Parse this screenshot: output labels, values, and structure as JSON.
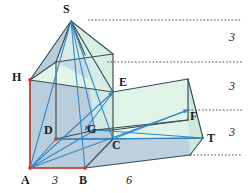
{
  "figure": {
    "colors": {
      "face_front_blue": "#b9cedc",
      "face_top_green": "#dff4e6",
      "face_side_green": "#cfeadd",
      "edge_dark": "#3a4a55",
      "construction_blue": "#2f86c8",
      "marker_red": "#e2382c",
      "dotted_gray": "#4a4a4a",
      "text": "#1b1b22"
    },
    "vertices": [
      {
        "name": "S",
        "label": "S",
        "x": 71,
        "y": 21,
        "lx": 63,
        "ly": 3
      },
      {
        "name": "H",
        "label": "H",
        "x": 30,
        "y": 80,
        "lx": 13,
        "ly": 71
      },
      {
        "name": "E",
        "label": "E",
        "x": 113,
        "y": 92,
        "lx": 119,
        "ly": 76
      },
      {
        "name": "F",
        "label": "F",
        "x": 188,
        "y": 110,
        "lx": 189,
        "ly": 108
      },
      {
        "name": "D",
        "label": "D",
        "x": 56,
        "y": 139,
        "lx": 44,
        "ly": 124
      },
      {
        "name": "G",
        "label": "G",
        "x": 95,
        "y": 130,
        "lx": 88,
        "ly": 124
      },
      {
        "name": "C",
        "label": "C",
        "x": 113,
        "y": 139,
        "lx": 112,
        "ly": 138
      },
      {
        "name": "T",
        "label": "T",
        "x": 203,
        "y": 138,
        "lx": 206,
        "ly": 132
      },
      {
        "name": "A",
        "label": "A",
        "x": 30,
        "y": 168,
        "lx": 22,
        "ly": 174
      },
      {
        "name": "B",
        "label": "B",
        "x": 85,
        "y": 168,
        "lx": 80,
        "ly": 174
      }
    ],
    "dimensions": [
      {
        "name": "edge-ab",
        "label": "3",
        "x": 52,
        "y": 174
      },
      {
        "name": "edge-bottom-right",
        "label": "6",
        "x": 126,
        "y": 174
      }
    ],
    "height_marks": [
      {
        "name": "height-1",
        "label": "3",
        "x": 229,
        "y": 31
      },
      {
        "name": "height-2",
        "label": "3",
        "x": 229,
        "y": 80
      },
      {
        "name": "height-3",
        "label": "3",
        "x": 229,
        "y": 126
      }
    ],
    "guide_lines": [
      {
        "name": "guide-top",
        "x1": 88,
        "y1": 20,
        "x2": 242,
        "y2": 20
      },
      {
        "name": "guide-roof-base",
        "x1": 107,
        "y1": 62,
        "x2": 242,
        "y2": 62
      },
      {
        "name": "guide-f-level",
        "x1": 188,
        "y1": 110,
        "x2": 242,
        "y2": 110
      },
      {
        "name": "guide-bottom",
        "x1": 190,
        "y1": 155,
        "x2": 242,
        "y2": 155
      }
    ]
  }
}
